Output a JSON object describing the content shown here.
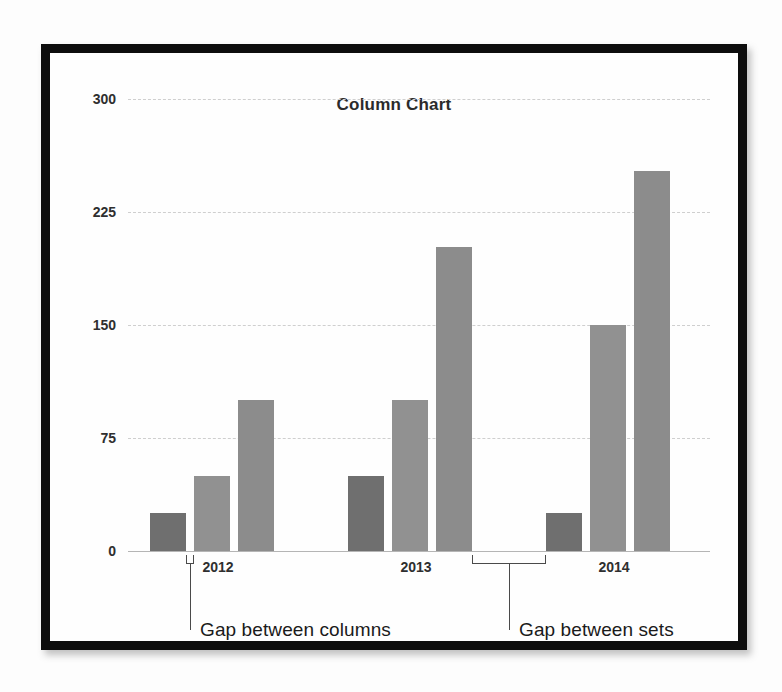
{
  "frame": {
    "border_color": "#0d0d0d",
    "background": "#ffffff"
  },
  "chart_data": {
    "type": "bar",
    "title": "Column Chart",
    "xlabel": "",
    "ylabel": "",
    "grid": true,
    "legend": "none",
    "categories": [
      "2012",
      "2013",
      "2014"
    ],
    "ylim": [
      0,
      300
    ],
    "yticks": [
      0,
      75,
      150,
      225,
      300
    ],
    "ytick_labels": [
      "0",
      "75",
      "150",
      "225",
      "300"
    ],
    "series": [
      {
        "name": "Series 1",
        "color": "#6f6f6f",
        "values": [
          25,
          50,
          25
        ]
      },
      {
        "name": "Series 2",
        "color": "#919191",
        "values": [
          50,
          100,
          150
        ]
      },
      {
        "name": "Series 3",
        "color": "#8c8c8c",
        "values": [
          100,
          202,
          252
        ]
      }
    ],
    "annotations": [
      {
        "id": "gap-between-columns",
        "text": "Gap between columns"
      },
      {
        "id": "gap-between-sets",
        "text": "Gap between sets"
      }
    ]
  }
}
